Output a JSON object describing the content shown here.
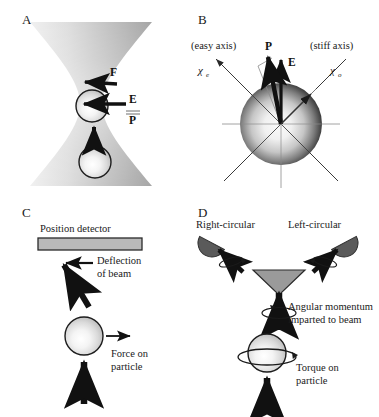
{
  "figure": {
    "panels": [
      {
        "letter": "A",
        "name": "optical-trap-force",
        "labels": [
          {
            "id": "force",
            "text": "F",
            "style": "bold"
          },
          {
            "id": "field",
            "text": "E",
            "style": "bold"
          },
          {
            "id": "polarization",
            "text": "P",
            "style": "bold"
          }
        ]
      },
      {
        "letter": "B",
        "name": "birefringent-axes",
        "labels": [
          {
            "id": "easy-axis",
            "text": "(easy axis)"
          },
          {
            "id": "stiff-axis",
            "text": "(stiff axis)"
          },
          {
            "id": "chi-e",
            "text": "χ",
            "sub": "e"
          },
          {
            "id": "chi-o",
            "text": "χ",
            "sub": "o"
          },
          {
            "id": "polarization",
            "text": "P",
            "style": "bold"
          },
          {
            "id": "field",
            "text": "E",
            "style": "bold"
          }
        ]
      },
      {
        "letter": "C",
        "name": "position-detection",
        "labels": [
          {
            "id": "detector",
            "text": "Position detector"
          },
          {
            "id": "deflection-line1",
            "text": "Deflection"
          },
          {
            "id": "deflection-line2",
            "text": "of beam"
          },
          {
            "id": "force-line1",
            "text": "Force on"
          },
          {
            "id": "force-line2",
            "text": "particle"
          }
        ]
      },
      {
        "letter": "D",
        "name": "angular-momentum-detection",
        "labels": [
          {
            "id": "right-circular",
            "text": "Right-circular"
          },
          {
            "id": "left-circular",
            "text": "Left-circular"
          },
          {
            "id": "angmom-line1",
            "text": "Angular momentum"
          },
          {
            "id": "angmom-line2",
            "text": "imparted to beam"
          },
          {
            "id": "torque-line1",
            "text": "Torque on"
          },
          {
            "id": "torque-line2",
            "text": "particle"
          }
        ]
      }
    ],
    "colors": {
      "ink": "#111111",
      "beam_dark": "#8f8f8f",
      "detector_fill": "#b9b9b9",
      "detector_stroke": "#2a2a2a",
      "half_disc_fill": "#5a5a5a",
      "prism_fill": "#9a9a9a",
      "sphere_highlight": "#fbfbfb",
      "sphere_edge": "#2b2b2b",
      "axis_gray": "#8a8a8a"
    }
  }
}
